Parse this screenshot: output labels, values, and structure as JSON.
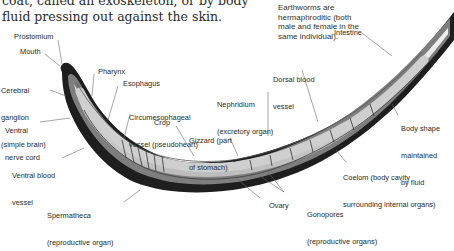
{
  "intro_text": {
    "line1": "coat, called an exoskeleton, or by body",
    "line2": "fluid pressing out against the skin."
  },
  "note": {
    "line1": "Earthworms are",
    "line2": "hermaphroditic (both",
    "line3": "male and female in the",
    "line4": "same individual)."
  },
  "labels": {
    "prostomium": "Prostomium",
    "mouth": "Mouth",
    "cerebral_ganglion": {
      "l1": "Cerebral",
      "l2": "ganglion",
      "l3": "(simple brain)"
    },
    "pharynx": "Pharynx",
    "esophagus": "Esophagus",
    "ventral_nerve_cord": {
      "l1": "Ventral",
      "l2": "nerve cord"
    },
    "circumesophageal_vessel": {
      "l1": "Circumesophageal",
      "l2": "vessel (pseudoheart)"
    },
    "crop": "Crop",
    "gizzard": {
      "l1": "Gizzard (part",
      "l2": "of stomach)"
    },
    "nephridium": {
      "l1": "Nephridium",
      "l2": "(excretory organ)"
    },
    "dorsal_blood_vessel": {
      "l1": "Dorsal blood",
      "l2": "vessel"
    },
    "intestine": "Intestine",
    "body_shape": {
      "l1": "Body shape",
      "l2": "maintained",
      "l3": "by fluid"
    },
    "ventral_blood_vessel": {
      "l1": "Ventral blood",
      "l2": "vessel"
    },
    "coelom": {
      "l1": "Coelom (body cavity",
      "l2": "surrounding internal organs)"
    },
    "spermatheca": {
      "l1": "Spermatheca",
      "l2": "(reproductive organ)"
    },
    "ovary": "Ovary",
    "gonopores": {
      "l1": "Gonopores",
      "l2": "(reproductive organs)"
    }
  },
  "colors": {
    "skin_dark": "#1e1e1e",
    "body_mid": "#8a8a8a",
    "interior_light": "#e6e6e6",
    "leader_line": "#6a6a6a",
    "text": "#2a2a2a"
  }
}
